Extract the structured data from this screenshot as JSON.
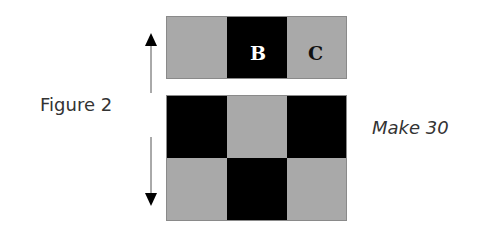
{
  "figure": {
    "label": "Figure 2",
    "quantity_label": "Make 30",
    "colors": {
      "light": "#a9a9a9",
      "dark": "#000000",
      "light_text": "#ffffff",
      "dark_text": "#111111"
    },
    "top_strip": {
      "cells": [
        {
          "shade": "light",
          "letter": ""
        },
        {
          "shade": "dark",
          "letter": "B"
        },
        {
          "shade": "light",
          "letter": "C"
        }
      ]
    },
    "bottom_grid": {
      "rows": [
        [
          "dark",
          "light",
          "dark"
        ],
        [
          "light",
          "dark",
          "light"
        ]
      ]
    },
    "arrow": {
      "direction": "vertical-double",
      "icon": "double-headed-arrow"
    }
  }
}
